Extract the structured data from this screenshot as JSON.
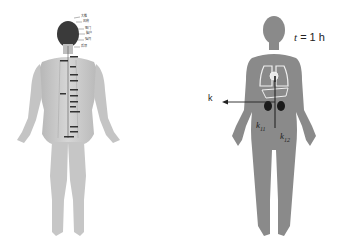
{
  "left_figure": {
    "description": "Back view of human body with acupoint labels along spine",
    "acupoint_labels": [
      "大椎",
      "风府",
      "哑门",
      "脑户",
      "强间",
      "后顶",
      "身柱",
      "神道",
      "灵台",
      "至阳",
      "筋缩",
      "中枢",
      "脊中",
      "悬枢",
      "命门",
      "腰阳关",
      "腰俞",
      "长强"
    ]
  },
  "right_figure": {
    "time_label_var": "t",
    "time_label_value": "= 1 h",
    "k_label": "k",
    "k11_base": "k",
    "k11_sub": "11",
    "k12_base": "k",
    "k12_sub": "12"
  },
  "colors": {
    "silhouette": "#8a8a8a",
    "skin": "#c8c8c8",
    "organ_outline": "#f0f0f0",
    "kidney": "#1a1a1a",
    "arrow": "#222222"
  }
}
